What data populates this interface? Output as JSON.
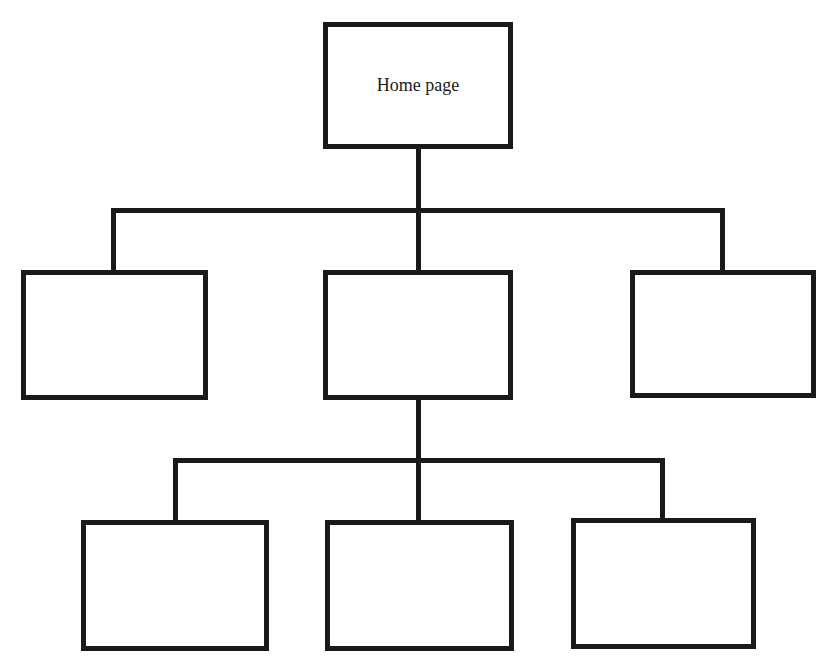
{
  "diagram": {
    "type": "site-map-hierarchy",
    "colors": {
      "stroke": "#1a1a1a",
      "background": "#ffffff"
    },
    "root": {
      "id": "home",
      "label": "Home page"
    },
    "level2": [
      {
        "id": "l2-left",
        "label": ""
      },
      {
        "id": "l2-center",
        "label": ""
      },
      {
        "id": "l2-right",
        "label": ""
      }
    ],
    "level3": [
      {
        "id": "l3-left",
        "parent": "l2-center",
        "label": ""
      },
      {
        "id": "l3-center",
        "parent": "l2-center",
        "label": ""
      },
      {
        "id": "l3-right",
        "parent": "l2-center",
        "label": ""
      }
    ]
  }
}
